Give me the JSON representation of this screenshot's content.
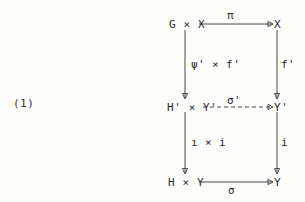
{
  "figure": {
    "kind": "commutative-diagram",
    "equation_number": "(1)",
    "background_color": "#fdfdfc",
    "ink_color": "#2b2b2b",
    "nodes": {
      "top_left": "G × X",
      "top_right": "X",
      "middle_left": "H' × Y'",
      "middle_right": "Y'",
      "bottom_left": "H × Y",
      "bottom_right": "Y"
    },
    "arrows": {
      "top_horizontal": {
        "label": "π",
        "from": "G × X",
        "to": "X",
        "style": "solid",
        "label_position": "above"
      },
      "middle_horizontal": {
        "label": "σ'",
        "from": "H' × Y'",
        "to": "Y'",
        "style": "dashed",
        "label_position": "above"
      },
      "bottom_horizontal": {
        "label": "σ",
        "from": "H × Y",
        "to": "Y",
        "style": "solid",
        "label_position": "below"
      },
      "left_upper_vertical": {
        "label": "ψ' × f'",
        "from": "G × X",
        "to": "H' × Y'",
        "style": "solid",
        "label_position": "right"
      },
      "left_lower_vertical": {
        "label": "ı × i",
        "from": "H' × Y'",
        "to": "H × Y",
        "style": "solid",
        "label_position": "right"
      },
      "right_upper_vertical": {
        "label": "f'",
        "from": "X",
        "to": "Y'",
        "style": "solid",
        "label_position": "right"
      },
      "right_lower_vertical": {
        "label": "i",
        "from": "Y'",
        "to": "Y",
        "style": "solid",
        "label_position": "right"
      }
    }
  }
}
